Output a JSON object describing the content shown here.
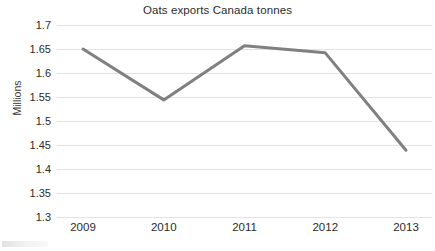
{
  "chart_data": {
    "type": "line",
    "title": "Oats exports Canada tonnes",
    "xlabel": "",
    "ylabel": "Millions",
    "categories": [
      "2009",
      "2010",
      "2011",
      "2012",
      "2013"
    ],
    "values": [
      1.65,
      1.544,
      1.657,
      1.642,
      1.439
    ],
    "series": [
      {
        "name": "Oats exports Canada tonnes",
        "values": [
          1.65,
          1.544,
          1.657,
          1.642,
          1.439
        ],
        "color": "#808080"
      }
    ],
    "ylim": [
      1.3,
      1.7
    ],
    "ytick_labels": [
      "1.7",
      "1.65",
      "1.6",
      "1.55",
      "1.5",
      "1.45",
      "1.4",
      "1.35",
      "1.3"
    ],
    "ytick_values": [
      1.7,
      1.65,
      1.6,
      1.55,
      1.5,
      1.45,
      1.4,
      1.35,
      1.3
    ],
    "xtick_labels": [
      "2009",
      "2010",
      "2011",
      "2012",
      "2013"
    ],
    "grid": true,
    "grid_color": "#e3e3e3",
    "legend": false,
    "legend_position": "none",
    "line_color": "#808080",
    "line_width": 3,
    "markers": false,
    "background": "#ffffff"
  },
  "style": {
    "title_color": "#2b2b2b",
    "tick_color": "#2b2b2b",
    "axis_label_color": "#3a3a3a"
  }
}
